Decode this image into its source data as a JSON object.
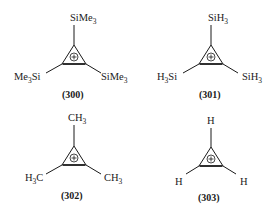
{
  "figure": {
    "type": "chemical-structures",
    "charge_symbol": "+",
    "structures": [
      {
        "id": "300",
        "caption": "(300)",
        "top": {
          "main": "SiMe",
          "sub": "3"
        },
        "left": {
          "pre": "Me",
          "sub": "3",
          "post": "Si"
        },
        "right": {
          "main": "SiMe",
          "sub": "3"
        }
      },
      {
        "id": "301",
        "caption": "(301)",
        "top": {
          "main": "SiH",
          "sub": "3"
        },
        "left": {
          "pre": "H",
          "sub": "3",
          "post": "Si"
        },
        "right": {
          "main": "SiH",
          "sub": "3"
        }
      },
      {
        "id": "302",
        "caption": "(302)",
        "top": {
          "main": "CH",
          "sub": "3"
        },
        "left": {
          "pre": "H",
          "sub": "3",
          "post": "C"
        },
        "right": {
          "main": "CH",
          "sub": "3"
        }
      },
      {
        "id": "303",
        "caption": "(303)",
        "top": {
          "main": "H",
          "sub": ""
        },
        "left": {
          "pre": "H",
          "sub": "",
          "post": ""
        },
        "right": {
          "main": "H",
          "sub": ""
        }
      }
    ]
  }
}
